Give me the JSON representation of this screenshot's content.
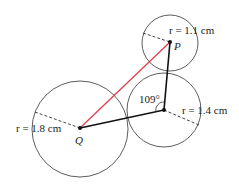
{
  "diagram": {
    "circles": [
      {
        "id": "top",
        "radius_label": "r = 1.1 cm",
        "point_label": "P"
      },
      {
        "id": "middle",
        "radius_label": "r = 1.4 cm",
        "angle_label": "109°"
      },
      {
        "id": "large",
        "radius_label": "r = 1.8 cm",
        "point_label": "Q"
      }
    ],
    "colors": {
      "pq_line": "#e0404f",
      "lines": "#111111",
      "circle": "#333333"
    }
  }
}
